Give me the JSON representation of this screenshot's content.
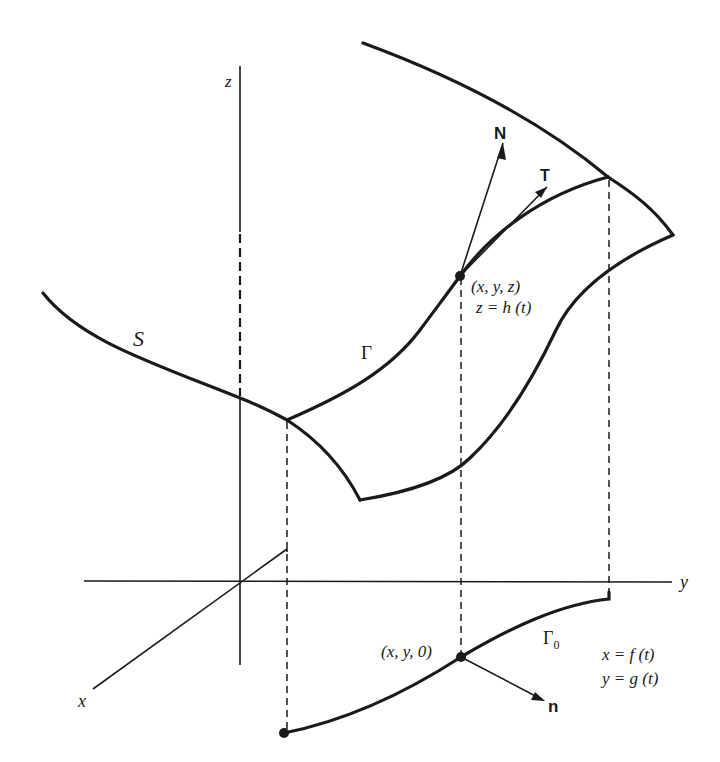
{
  "diagram": {
    "axes": {
      "x_label": "x",
      "y_label": "y",
      "z_label": "z"
    },
    "labels": {
      "surface": "S",
      "curve": "Γ",
      "projected_curve": "Γ",
      "projected_curve_subscript": "0",
      "normal_vector": "N",
      "tangent_vector": "T",
      "plane_normal": "n",
      "point_3d": "(x, y, z)",
      "point_3d_param": "z = h (t)",
      "point_2d": "(x, y, 0)",
      "param_x": "x = f (t)",
      "param_y": "y = g (t)"
    },
    "colors": {
      "ink": "#1a1a1a",
      "background": "#ffffff"
    }
  }
}
